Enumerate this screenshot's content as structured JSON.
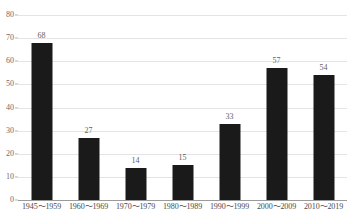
{
  "chart_data": {
    "type": "bar",
    "title": "",
    "subtitle": "",
    "xlabel": "",
    "ylabel": "",
    "categories": [
      "1945～1959",
      "1960～1969",
      "1970～1979",
      "1980～1989",
      "1990～1999",
      "2000～2009",
      "2010～2019"
    ],
    "values": [
      68,
      27,
      14,
      15,
      33,
      57,
      54
    ],
    "value_labels": [
      "68",
      "27",
      "14",
      "15",
      "33",
      "57",
      "54"
    ],
    "ylim": [
      0,
      80
    ],
    "ytick_values": [
      0,
      10,
      20,
      30,
      40,
      50,
      60,
      70,
      80
    ],
    "ytick_labels": [
      "0",
      "10",
      "20",
      "30",
      "40",
      "50",
      "60",
      "70",
      "80"
    ],
    "grid": true,
    "legend": false,
    "legend_position": "none",
    "series": [
      {
        "name": "count",
        "values": [
          68,
          27,
          14,
          15,
          33,
          57,
          54
        ]
      }
    ]
  },
  "colors": {
    "bar": "#1a1a1a",
    "gridline": "#e4e4e4",
    "axis": "#9a9a9a",
    "tick_text": "#6b6b6b",
    "value_text": "#5f5f5f",
    "category_text": "#4a4a4a",
    "background": "#ffffff"
  }
}
